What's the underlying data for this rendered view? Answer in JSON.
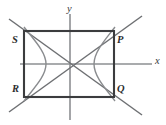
{
  "figure": {
    "kind": "analytic-geometry-diagram",
    "colors": {
      "background": "#ffffff",
      "axis": "#8d8f92",
      "rectangle": "#3b3c3e",
      "asymptote": "#6e7073",
      "hyperbola": "#8a8c8f",
      "label": "#2c2d2f"
    },
    "axes": {
      "x_label": "x",
      "y_label": "y",
      "origin": {
        "x": 70,
        "y": 64
      },
      "x_extent": [
        20,
        152
      ],
      "y_extent": [
        14,
        120
      ]
    },
    "rectangle": {
      "name": "PQRS",
      "left": 24,
      "right": 114,
      "top": 31,
      "bottom": 97,
      "vertices": [
        {
          "label": "S",
          "position": "top-left",
          "x": 24,
          "y": 31
        },
        {
          "label": "P",
          "position": "top-right",
          "x": 114,
          "y": 31
        },
        {
          "label": "Q",
          "position": "bottom-right",
          "x": 114,
          "y": 97
        },
        {
          "label": "R",
          "position": "bottom-left",
          "x": 24,
          "y": 97
        }
      ]
    },
    "hyperbola": {
      "orientation": "horizontal",
      "left_vertex": {
        "x": 46,
        "y": 64
      },
      "right_vertex": {
        "x": 94,
        "y": 64
      },
      "branches": 2
    },
    "asymptotes": {
      "count": 2,
      "through": [
        "S and Q",
        "R and P"
      ],
      "slopes": [
        "negative",
        "positive"
      ]
    },
    "labels": [
      {
        "id": "S",
        "text": "S"
      },
      {
        "id": "P",
        "text": "P"
      },
      {
        "id": "R",
        "text": "R"
      },
      {
        "id": "Q",
        "text": "Q"
      },
      {
        "id": "x",
        "text": "x"
      },
      {
        "id": "y",
        "text": "y"
      }
    ]
  }
}
